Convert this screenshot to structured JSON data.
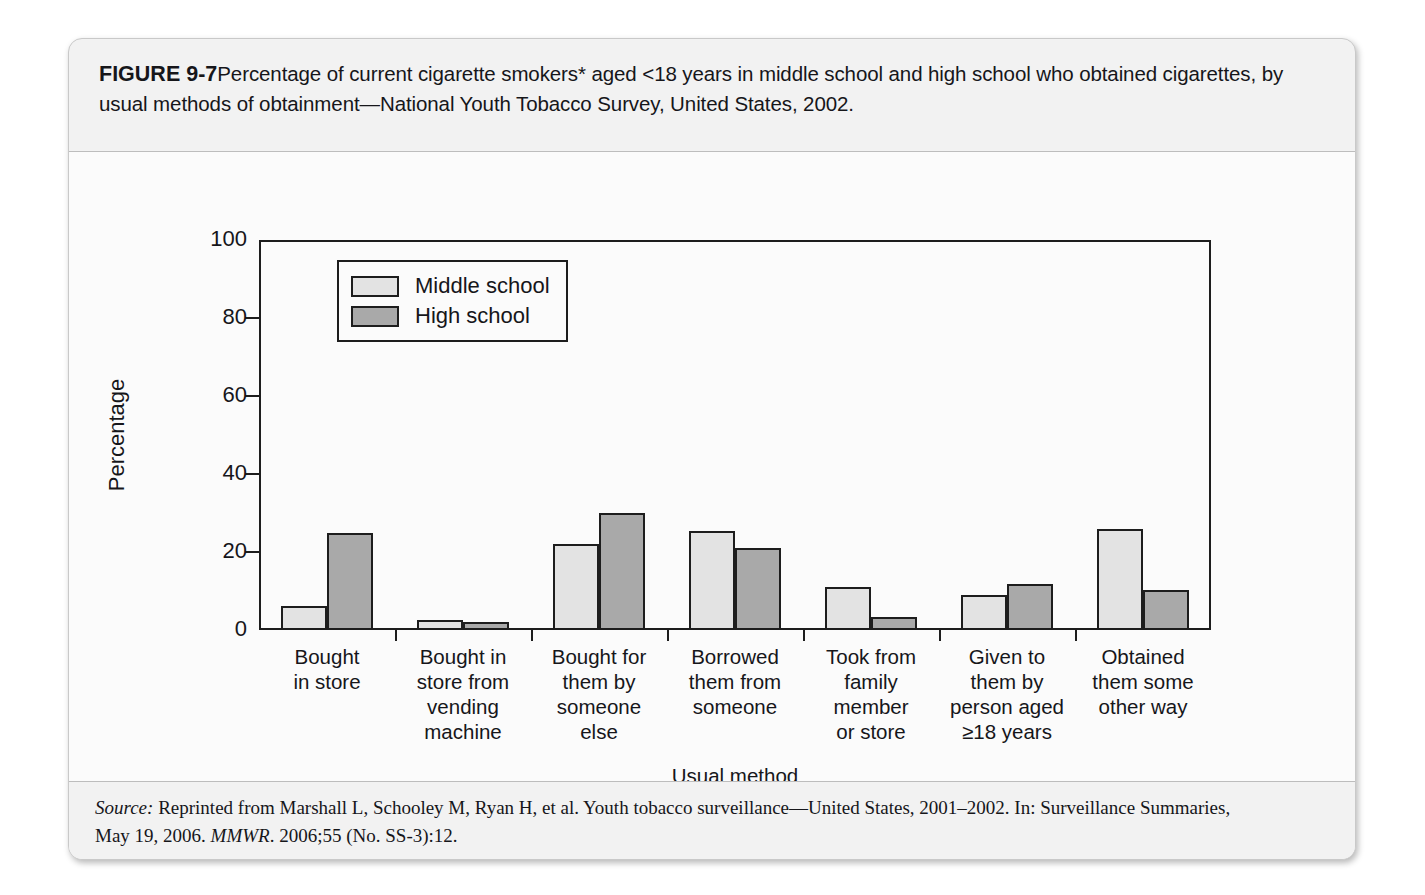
{
  "figure": {
    "number": "FIGURE 9-7",
    "caption": "Percentage of current cigarette smokers* aged <18 years in middle school and high school who obtained cigarettes, by usual methods of obtainment—National Youth Tobacco Survey, United States, 2002.",
    "footnote": "*Smoked cigarettes on ≥1 of the 30 days preceding the survey.",
    "source_label": "Source:",
    "source_line1": " Reprinted from Marshall L, Schooley M, Ryan H, et al. Youth tobacco surveillance—United States, 2001–2002. In: Surveillance Summaries,",
    "source_line2_pre": "May 19, 2006. ",
    "source_line2_italic": "MMWR",
    "source_line2_post": ". 2006;55 (No. SS-3):12."
  },
  "chart_data": {
    "type": "bar",
    "title": "",
    "xlabel": "Usual method",
    "ylabel": "Percentage",
    "ylim": [
      0,
      100
    ],
    "yticks": [
      0,
      20,
      40,
      60,
      80,
      100
    ],
    "grid": false,
    "legend_position": "top-left-inside",
    "categories": [
      "Bought\nin store",
      "Bought in\nstore from\nvending\nmachine",
      "Bought for\nthem by\nsomeone\nelse",
      "Borrowed\nthem from\nsomeone",
      "Took from\nfamily\nmember\nor store",
      "Given to\nthem by\nperson aged\n≥18 years",
      "Obtained\nthem some\nother way"
    ],
    "category_lines": [
      [
        "Bought",
        "in store"
      ],
      [
        "Bought in",
        "store from",
        "vending",
        "machine"
      ],
      [
        "Bought for",
        "them by",
        "someone",
        "else"
      ],
      [
        "Borrowed",
        "them from",
        "someone"
      ],
      [
        "Took from",
        "family",
        "member",
        "or store"
      ],
      [
        "Given to",
        "them by",
        "person aged",
        "≥18 years"
      ],
      [
        "Obtained",
        "them some",
        "other way"
      ]
    ],
    "series": [
      {
        "name": "Middle school",
        "color": "#e3e3e3",
        "values": [
          6.2,
          2.5,
          22.0,
          25.4,
          11.1,
          9.1,
          26.0
        ]
      },
      {
        "name": "High school",
        "color": "#a9a9a9",
        "values": [
          24.8,
          2.0,
          30.1,
          21.0,
          3.4,
          11.8,
          10.3
        ]
      }
    ]
  },
  "colors": {
    "middle_school": "#e3e3e3",
    "high_school": "#a9a9a9",
    "axis": "#1d1d1d",
    "card_bg": "#f2f2f2",
    "plot_bg": "#fbfbfb"
  }
}
